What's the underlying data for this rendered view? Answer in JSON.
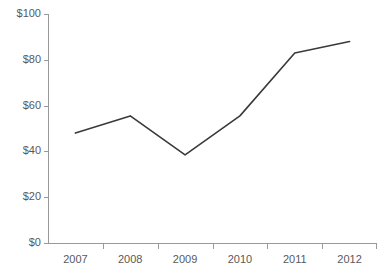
{
  "chart_data": {
    "type": "line",
    "title": "",
    "subtitle": "",
    "xlabel": "",
    "ylabel": "",
    "categories": [
      "2007",
      "2008",
      "2009",
      "2010",
      "2011",
      "2012"
    ],
    "series": [
      {
        "name": "",
        "values": [
          48,
          55.5,
          38.5,
          55.5,
          83,
          88
        ],
        "color": "#3a3a3a"
      }
    ],
    "ylim": [
      0,
      100
    ],
    "y_ticks": [
      0,
      20,
      40,
      60,
      80,
      100
    ],
    "y_tick_labels": [
      "$0",
      "$20",
      "$40",
      "$60",
      "$80",
      "$100"
    ],
    "x_tick_labels": [
      "2007",
      "2008",
      "2009",
      "2010",
      "2011",
      "2012"
    ],
    "grid": false,
    "legend": false,
    "legend_position": "none",
    "markers": false,
    "axis_color": "#999999",
    "tick_label_color": "#595959",
    "background_color": "#ffffff",
    "plot_area": {
      "left": 48,
      "right": 377,
      "top": 14,
      "bottom": 243
    }
  }
}
